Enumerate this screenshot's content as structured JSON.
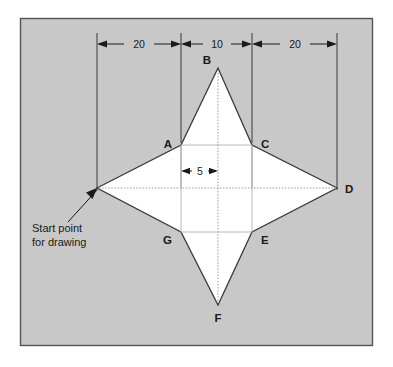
{
  "figure": {
    "panel": {
      "background_color": "#c8c8c8",
      "border_color": "#555555",
      "outer_background_color": "#ffffff"
    },
    "shape": {
      "fill_color": "#ffffff",
      "outline_color": "#3a3a3a",
      "name": "four-point-star"
    },
    "dimensions": [
      {
        "id": "dim-left",
        "label": "20",
        "orientation": "horizontal"
      },
      {
        "id": "dim-center",
        "label": "10",
        "orientation": "horizontal"
      },
      {
        "id": "dim-right",
        "label": "20",
        "orientation": "horizontal"
      },
      {
        "id": "dim-half",
        "label": "5",
        "orientation": "horizontal"
      }
    ],
    "vertices": [
      {
        "id": "vertex-a",
        "label": "A"
      },
      {
        "id": "vertex-b",
        "label": "B"
      },
      {
        "id": "vertex-c",
        "label": "C"
      },
      {
        "id": "vertex-d",
        "label": "D"
      },
      {
        "id": "vertex-e",
        "label": "E"
      },
      {
        "id": "vertex-f",
        "label": "F"
      },
      {
        "id": "vertex-g",
        "label": "G"
      }
    ],
    "annotation": {
      "id": "start-point-note",
      "line1": "Start point",
      "line2": "for drawing"
    }
  }
}
